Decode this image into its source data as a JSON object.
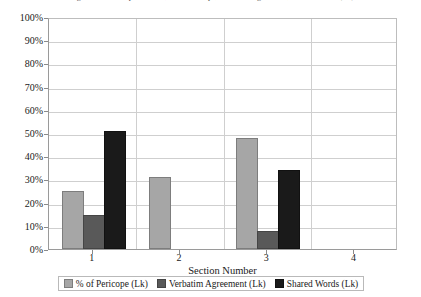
{
  "figure": {
    "caption": "Figure 5.9: Pericope Number, % of Pericope, Verbatim Agreement, Shared Words (Lk)"
  },
  "chart_data": {
    "type": "bar",
    "title": "",
    "xlabel": "Section Number",
    "ylabel": "",
    "categories": [
      "1",
      "2",
      "3",
      "4"
    ],
    "series": [
      {
        "name": "% of Pericope (Lk)",
        "color": "#a6a6a6",
        "values": [
          24,
          30,
          47,
          0
        ]
      },
      {
        "name": "Verbatim Agreement (Lk)",
        "color": "#595959",
        "values": [
          14,
          0,
          7,
          0
        ]
      },
      {
        "name": "Shared Words (Lk)",
        "color": "#1a1a1a",
        "values": [
          50,
          0,
          33,
          0
        ]
      }
    ],
    "ylim": [
      0,
      100
    ],
    "ytick_labels": [
      "100%",
      "90%",
      "80%",
      "70%",
      "60%",
      "50%",
      "40%",
      "30%",
      "20%",
      "10%",
      "0%"
    ],
    "ytick_values": [
      100,
      90,
      80,
      70,
      60,
      50,
      40,
      30,
      20,
      10,
      0
    ],
    "grid": true,
    "legend_position": "bottom",
    "value_suffix": "%"
  }
}
